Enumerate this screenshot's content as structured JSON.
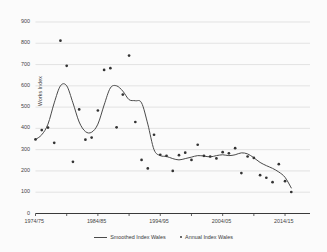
{
  "chart_data": {
    "type": "line",
    "title": "",
    "xlabel": "",
    "ylabel": "Works Index",
    "ylim": [
      0,
      900
    ],
    "ytick_step": 100,
    "yticks": [
      0,
      100,
      200,
      300,
      400,
      500,
      600,
      700,
      800,
      900
    ],
    "ytick_labels": [
      "0",
      "100",
      "200",
      "300",
      "400",
      "500",
      "600",
      "700",
      "800",
      "900"
    ],
    "xticks": [
      "1974/75",
      "1984/85",
      "1994/95",
      "2004/05",
      "2014/15"
    ],
    "xtick_years": [
      1974,
      1984,
      1994,
      2004,
      2014
    ],
    "x_range": [
      1974,
      2018
    ],
    "grid": "horizontal",
    "legend_position": "bottom",
    "legend": [
      "Smoothed Index Wales",
      "Annual Index Wales"
    ],
    "colors": {
      "line": "#4a4a4a",
      "marker": "#333333",
      "grid": "#d8d8d8",
      "axis": "#3a3a3a",
      "background": "#fbfbfb"
    },
    "series": [
      {
        "name": "Annual Index Wales",
        "type": "scatter",
        "x": [
          1974,
          1975,
          1976,
          1977,
          1978,
          1979,
          1980,
          1981,
          1982,
          1983,
          1984,
          1985,
          1986,
          1987,
          1988,
          1989,
          1990,
          1991,
          1992,
          1993,
          1994,
          1995,
          1996,
          1997,
          1998,
          1999,
          2000,
          2001,
          2002,
          2003,
          2004,
          2005,
          2006,
          2007,
          2008,
          2009,
          2010,
          2011,
          2012,
          2013,
          2014,
          2015,
          2016,
          2017
        ],
        "values": [
          348,
          392,
          404,
          332,
          812,
          694,
          243,
          489,
          347,
          357,
          484,
          675,
          683,
          405,
          559,
          742,
          430,
          252,
          212,
          370,
          276,
          271,
          200,
          274,
          286,
          252,
          323,
          271,
          268,
          259,
          288,
          283,
          307,
          190,
          268,
          261,
          180,
          168,
          147,
          232,
          152,
          101,
          null,
          null
        ]
      },
      {
        "name": "Smoothed Index Wales",
        "type": "line",
        "x": [
          1974,
          1975,
          1976,
          1977,
          1978,
          1979,
          1980,
          1981,
          1982,
          1983,
          1984,
          1985,
          1986,
          1987,
          1988,
          1989,
          1990,
          1991,
          1992,
          1993,
          1994,
          1995,
          1996,
          1997,
          1998,
          1999,
          2000,
          2001,
          2002,
          2003,
          2004,
          2005,
          2006,
          2007,
          2008,
          2009,
          2010,
          2011,
          2012,
          2013,
          2014,
          2015
        ],
        "values": [
          348,
          370,
          420,
          520,
          600,
          600,
          520,
          430,
          385,
          382,
          420,
          510,
          590,
          600,
          575,
          535,
          530,
          520,
          420,
          300,
          272,
          268,
          258,
          252,
          258,
          265,
          272,
          270,
          266,
          272,
          276,
          272,
          276,
          285,
          280,
          262,
          240,
          225,
          212,
          195,
          170,
          120
        ]
      }
    ]
  },
  "axes": {
    "y_title": "Works Index"
  }
}
